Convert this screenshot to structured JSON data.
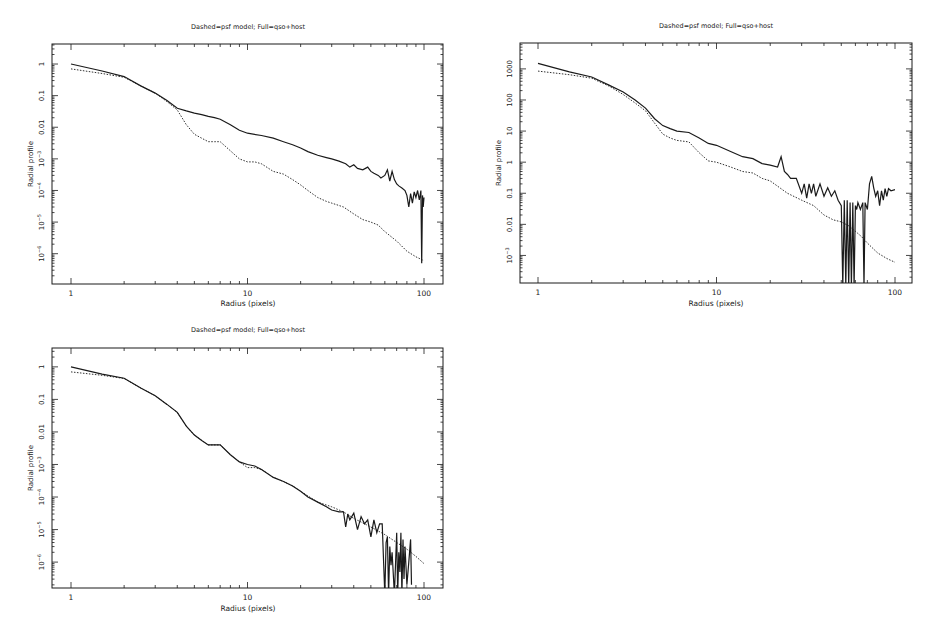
{
  "chart_data": [
    {
      "type": "line",
      "title": "Dashed=psf model; Full=qso+host",
      "xlabel": "Radius (pixels)",
      "ylabel": "Radial profile",
      "xscale": "log",
      "yscale": "log",
      "xlim": [
        0.8,
        125
      ],
      "ylim": [
        1.1e-07,
        4.3
      ],
      "x_ticks": [
        {
          "v": 1,
          "label": "1"
        },
        {
          "v": 10,
          "label": "10"
        },
        {
          "v": 100,
          "label": "100"
        }
      ],
      "y_ticks": [
        {
          "v": 1,
          "label": "1"
        },
        {
          "v": 0.1,
          "label": "0.1"
        },
        {
          "v": 0.01,
          "label": "0.01"
        },
        {
          "v": 0.001,
          "label": "10^-3"
        },
        {
          "v": 0.0001,
          "label": "10^-4"
        },
        {
          "v": 1e-05,
          "label": "10^-5"
        },
        {
          "v": 1e-06,
          "label": "10^-6"
        }
      ],
      "grid": false,
      "legend": "none (described in title)",
      "series": [
        {
          "name": "qso+host (Full)",
          "style": "solid",
          "x": [
            1,
            1.5,
            2,
            2.5,
            3,
            3.5,
            4,
            4.5,
            5,
            5.5,
            6,
            6.5,
            7,
            8,
            9,
            10,
            12,
            14,
            16,
            18,
            20,
            22,
            25,
            28,
            30,
            33,
            36,
            38,
            40,
            42,
            45,
            48,
            50,
            52,
            55,
            57,
            60,
            62,
            64,
            66,
            68,
            70,
            72,
            75,
            78,
            80,
            82,
            84,
            86,
            88,
            90,
            92,
            94,
            96,
            97,
            98,
            99,
            100
          ],
          "y": [
            1.0,
            0.6,
            0.4,
            0.2,
            0.12,
            0.07,
            0.04,
            0.033,
            0.028,
            0.025,
            0.022,
            0.02,
            0.018,
            0.012,
            0.008,
            0.0065,
            0.0055,
            0.0045,
            0.0035,
            0.0028,
            0.0022,
            0.0017,
            0.0013,
            0.0011,
            0.001,
            0.00085,
            0.0007,
            0.00055,
            0.00065,
            0.0005,
            0.00045,
            0.00055,
            0.0004,
            0.00035,
            0.0003,
            0.00025,
            0.0003,
            0.00045,
            0.0002,
            0.0004,
            0.00022,
            0.00016,
            0.00014,
            0.00012,
            0.0001,
            7e-05,
            3e-05,
            8e-05,
            4e-05,
            9e-05,
            6e-05,
            0.0001,
            5e-05,
            0.0001,
            5e-07,
            7e-05,
            3e-05,
            6e-05
          ]
        },
        {
          "name": "psf model (Dashed)",
          "style": "dashed",
          "x": [
            1,
            1.5,
            2,
            2.5,
            3,
            3.5,
            4,
            4.5,
            5,
            5.5,
            6,
            6.5,
            7,
            8,
            9,
            10,
            11,
            12,
            14,
            16,
            18,
            20,
            22,
            25,
            28,
            30,
            35,
            40,
            45,
            50,
            55,
            60,
            70,
            80,
            90,
            100
          ],
          "y": [
            0.7,
            0.5,
            0.38,
            0.2,
            0.12,
            0.065,
            0.035,
            0.012,
            0.006,
            0.0045,
            0.0035,
            0.0035,
            0.0035,
            0.0018,
            0.001,
            0.0008,
            0.0008,
            0.0007,
            0.0004,
            0.00033,
            0.00022,
            0.00015,
            0.0001,
            6e-05,
            4.5e-05,
            4e-05,
            3e-05,
            1.8e-05,
            1.2e-05,
            1e-05,
            8e-06,
            5e-06,
            2.5e-06,
            1.2e-06,
            8e-07,
            6e-07
          ]
        }
      ]
    },
    {
      "type": "line",
      "title": "Dashed=psf model; Full=qso+host",
      "xlabel": "Radius (pixels)",
      "ylabel": "Radial profile",
      "xscale": "log",
      "yscale": "log",
      "xlim": [
        0.8,
        125
      ],
      "ylim": [
        0.00013,
        6800
      ],
      "x_ticks": [
        {
          "v": 1,
          "label": "1"
        },
        {
          "v": 10,
          "label": "10"
        },
        {
          "v": 100,
          "label": "100"
        }
      ],
      "y_ticks": [
        {
          "v": 1000,
          "label": "1000"
        },
        {
          "v": 100,
          "label": "100"
        },
        {
          "v": 10,
          "label": "10"
        },
        {
          "v": 1,
          "label": "1"
        },
        {
          "v": 0.1,
          "label": "0.1"
        },
        {
          "v": 0.01,
          "label": "0.01"
        },
        {
          "v": 0.001,
          "label": "10^-3"
        }
      ],
      "grid": false,
      "legend": "none (described in title)",
      "series": [
        {
          "name": "qso+host (Full)",
          "style": "solid",
          "x": [
            1,
            1.5,
            2,
            2.5,
            3,
            3.5,
            4,
            4.5,
            5,
            5.5,
            6,
            7,
            8,
            9,
            10,
            12,
            14,
            16,
            18,
            20,
            22,
            23,
            24,
            25,
            26,
            28,
            30,
            31,
            32,
            33,
            34,
            35,
            36,
            38,
            40,
            42,
            44,
            46,
            48,
            50,
            51,
            52,
            53,
            54,
            55,
            56,
            57,
            58,
            59,
            60,
            61,
            62,
            64,
            66,
            67,
            68,
            70,
            72,
            74,
            76,
            78,
            80,
            82,
            84,
            86,
            88,
            90,
            92,
            95,
            100
          ],
          "y": [
            1500,
            800,
            550,
            300,
            180,
            100,
            55,
            25,
            15,
            12,
            10,
            9,
            6,
            4,
            3.5,
            2.2,
            1.5,
            1.3,
            0.9,
            0.8,
            0.7,
            1.5,
            0.5,
            0.4,
            0.3,
            0.3,
            0.1,
            0.2,
            0.07,
            0.2,
            0.1,
            0.2,
            0.08,
            0.2,
            0.08,
            0.15,
            0.08,
            0.12,
            0.06,
            0.04,
            0.0001,
            0.06,
            0.0001,
            0.06,
            0.0001,
            0.05,
            0.0001,
            0.05,
            0.0001,
            0.04,
            0.03,
            0.05,
            0.03,
            0.05,
            0.0001,
            0.05,
            0.03,
            0.2,
            0.35,
            0.15,
            0.08,
            0.12,
            0.04,
            0.12,
            0.06,
            0.14,
            0.08,
            0.14,
            0.12,
            0.13
          ]
        },
        {
          "name": "psf model (Dashed)",
          "style": "dashed",
          "x": [
            1,
            1.5,
            2,
            2.5,
            3,
            3.5,
            4,
            4.5,
            5,
            5.5,
            6,
            7,
            8,
            9,
            10,
            12,
            14,
            16,
            18,
            20,
            25,
            30,
            35,
            40,
            45,
            50,
            55,
            60,
            65,
            70,
            80,
            90,
            100
          ],
          "y": [
            850,
            650,
            500,
            280,
            150,
            80,
            45,
            18,
            8,
            6,
            5,
            4.5,
            2,
            1.1,
            1,
            0.7,
            0.5,
            0.45,
            0.3,
            0.25,
            0.1,
            0.06,
            0.04,
            0.02,
            0.014,
            0.012,
            0.009,
            0.006,
            0.004,
            0.0025,
            0.0012,
            0.0008,
            0.0006
          ]
        }
      ]
    },
    {
      "type": "line",
      "title": "Dashed=psf model; Full=qso+host",
      "xlabel": "Radius (pixels)",
      "ylabel": "Radial profile",
      "xscale": "log",
      "yscale": "log",
      "xlim": [
        0.8,
        125
      ],
      "ylim": [
        1.6e-07,
        3.8
      ],
      "x_ticks": [
        {
          "v": 1,
          "label": "1"
        },
        {
          "v": 10,
          "label": "10"
        },
        {
          "v": 100,
          "label": "100"
        }
      ],
      "y_ticks": [
        {
          "v": 1,
          "label": "1"
        },
        {
          "v": 0.1,
          "label": "0.1"
        },
        {
          "v": 0.01,
          "label": "0.01"
        },
        {
          "v": 0.001,
          "label": "10^-3"
        },
        {
          "v": 0.0001,
          "label": "10^-4"
        },
        {
          "v": 1e-05,
          "label": "10^-5"
        },
        {
          "v": 1e-06,
          "label": "10^-6"
        }
      ],
      "grid": false,
      "legend": "none (described in title)",
      "series": [
        {
          "name": "qso+host (Full)",
          "style": "solid",
          "x": [
            1,
            1.5,
            2,
            2.5,
            3,
            3.5,
            4,
            4.5,
            5,
            5.5,
            6,
            7,
            8,
            9,
            10,
            11,
            12,
            14,
            16,
            18,
            20,
            22,
            25,
            28,
            30,
            33,
            35,
            36,
            37,
            38,
            40,
            42,
            44,
            46,
            48,
            50,
            52,
            54,
            56,
            58,
            60,
            61,
            62,
            63,
            64,
            65,
            66,
            68,
            70,
            71,
            72,
            73,
            74,
            75,
            76,
            77,
            78,
            80,
            82,
            84,
            85
          ],
          "y": [
            1.0,
            0.6,
            0.45,
            0.22,
            0.13,
            0.07,
            0.04,
            0.015,
            0.008,
            0.0055,
            0.004,
            0.004,
            0.002,
            0.0012,
            0.001,
            0.0009,
            0.0007,
            0.0004,
            0.0003,
            0.00022,
            0.00015,
            0.0001,
            7e-05,
            5e-05,
            4e-05,
            3.5e-05,
            3.5e-05,
            1.2e-05,
            3e-05,
            2e-05,
            3.2e-05,
            1e-05,
            2.5e-05,
            1.5e-05,
            2e-05,
            6e-06,
            2e-05,
            8e-06,
            1.5e-05,
            1.5e-05,
            1e-07,
            4e-06,
            6e-06,
            1e-07,
            3e-06,
            8e-07,
            2e-06,
            1e-07,
            8e-06,
            1e-07,
            2e-06,
            5e-07,
            8e-06,
            1e-07,
            5e-06,
            3e-07,
            3e-06,
            2e-07,
            1e-06,
            5e-06,
            2e-07
          ]
        },
        {
          "name": "psf model (Dashed)",
          "style": "dashed",
          "x": [
            1,
            1.5,
            2,
            2.5,
            3,
            3.5,
            4,
            4.5,
            5,
            5.5,
            6,
            7,
            8,
            9,
            10,
            11,
            12,
            14,
            16,
            18,
            20,
            25,
            30,
            35,
            40,
            50,
            60,
            70,
            80,
            90,
            100
          ],
          "y": [
            0.7,
            0.55,
            0.44,
            0.22,
            0.13,
            0.07,
            0.04,
            0.015,
            0.008,
            0.0055,
            0.004,
            0.004,
            0.002,
            0.0012,
            0.0008,
            0.0008,
            0.0007,
            0.0004,
            0.0003,
            0.00022,
            0.00015,
            7e-05,
            5e-05,
            3.5e-05,
            2.2e-05,
            1.2e-05,
            7e-06,
            4e-06,
            2.5e-06,
            1.5e-06,
            9e-07
          ]
        }
      ]
    }
  ],
  "panels": [
    {
      "title": "Dashed=psf model; Full=qso+host",
      "xlabel": "Radius (pixels)",
      "ylabel": "Radial profile"
    },
    {
      "title": "Dashed=psf model; Full=qso+host",
      "xlabel": "Radius (pixels)",
      "ylabel": "Radial profile"
    },
    {
      "title": "Dashed=psf model; Full=qso+host",
      "xlabel": "Radius (pixels)",
      "ylabel": "Radial profile"
    }
  ],
  "style": {
    "ink": "#1a1a1a",
    "background": "#ffffff"
  }
}
